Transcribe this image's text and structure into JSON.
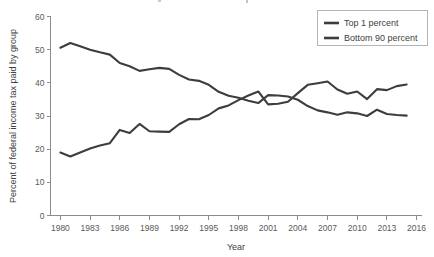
{
  "chart_data": {
    "type": "line",
    "title": "",
    "xlabel": "Year",
    "ylabel": "Percent of federal income tax paid by group",
    "xlim": [
      1979,
      2016.5
    ],
    "ylim": [
      0,
      60
    ],
    "grid": false,
    "legend_position": "top-right",
    "xticks": [
      1980,
      1983,
      1986,
      1989,
      1992,
      1995,
      1998,
      2001,
      2004,
      2007,
      2010,
      2013,
      2016
    ],
    "xtick_labels": [
      "1980",
      "1983",
      "1986",
      "1989",
      "1992",
      "1995",
      "1998",
      "2001",
      "2004",
      "2007",
      "2010",
      "2013",
      "2016"
    ],
    "yticks": [
      0,
      10,
      20,
      30,
      40,
      50,
      60
    ],
    "ytick_labels": [
      "0",
      "10",
      "20",
      "30",
      "40",
      "50",
      "60"
    ],
    "x": [
      1980,
      1981,
      1982,
      1983,
      1984,
      1985,
      1986,
      1987,
      1988,
      1989,
      1990,
      1991,
      1992,
      1993,
      1994,
      1995,
      1996,
      1997,
      1998,
      1999,
      2000,
      2001,
      2002,
      2003,
      2004,
      2005,
      2006,
      2007,
      2008,
      2009,
      2010,
      2011,
      2012,
      2013,
      2014,
      2015
    ],
    "series": [
      {
        "name": "Top 1 percent",
        "color": "#3d3d3f",
        "values": [
          19.0,
          17.8,
          19.0,
          20.2,
          21.1,
          21.8,
          25.8,
          24.9,
          27.6,
          25.4,
          25.3,
          25.2,
          27.5,
          29.1,
          29.0,
          30.3,
          32.3,
          33.2,
          34.8,
          36.2,
          37.4,
          33.5,
          33.7,
          34.3,
          36.9,
          39.4,
          39.9,
          40.4,
          38.0,
          36.7,
          37.4,
          35.1,
          38.1,
          37.8,
          39.0,
          39.5
        ]
      },
      {
        "name": "Bottom 90 percent",
        "color": "#3d3d3f",
        "values": [
          50.6,
          52.0,
          51.0,
          50.0,
          49.2,
          48.5,
          46.0,
          45.0,
          43.6,
          44.1,
          44.5,
          44.2,
          42.4,
          41.0,
          40.6,
          39.4,
          37.3,
          36.1,
          35.5,
          34.6,
          33.9,
          36.3,
          36.2,
          35.9,
          34.9,
          33.0,
          31.7,
          31.1,
          30.4,
          31.1,
          30.8,
          30.0,
          31.9,
          30.6,
          30.3,
          30.1
        ]
      }
    ],
    "legend": [
      {
        "label": "Top 1 percent",
        "color": "#3d3d3f"
      },
      {
        "label": "Bottom 90 percent",
        "color": "#3d3d3f"
      }
    ]
  }
}
